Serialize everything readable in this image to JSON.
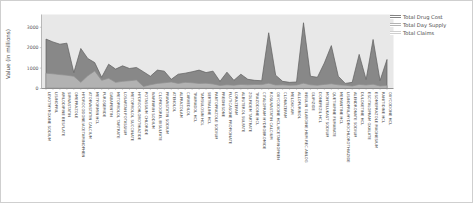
{
  "chart_data": {
    "type": "area",
    "title": "",
    "xlabel": "",
    "ylabel": "Value (in millions)",
    "ylim": [
      0,
      3400
    ],
    "yticks": [
      0,
      1000,
      2000,
      3000
    ],
    "grid": false,
    "legend_position": "top-right",
    "plot_bg_color": "#e8e8e8",
    "axis_text_color": "#555555",
    "categories": [
      "LEVOTHYROXINE SODIUM",
      "LISINOPRIL",
      "AMLODIPINE BESYLATE",
      "SIMVASTATIN",
      "OMEPRAZOLE",
      "HYDROCODONE/ACETAMINOPHEN",
      "ATORVASTATIN CALCIUM",
      "METFORMIN HCL",
      "FUROSEMIDE",
      "GABAPENTIN",
      "METOPROLOL TARTRATE",
      "LOSARTAN POTASSIUM",
      "METOPROLOL SUCCINATE",
      "HYDROCHLOROTHIAZIDE",
      "POTASSIUM CHLORIDE",
      "WARFARIN SODIUM",
      "CLOPIDOGREL BISULFATE",
      "PRAVASTATIN SODIUM",
      "ATENOLOL",
      "ALPRAZOLAM",
      "CARVEDILOL",
      "TRAMADOL HCL",
      "TAMSULOSIN HCL",
      "SERTRALINE HCL",
      "PANTOPRAZOLE SODIUM",
      "PREDNISONE",
      "FLUTICASONE PROPIONATE",
      "LORAZEPAM",
      "ALBUTEROL SULFATE",
      "ZOLPIDEM TARTRATE",
      "TRAZODONE HCL",
      "CITALOPRAM HYDROBROMIDE",
      "ROSUVASTATIN CALCIUM",
      "OXYCODONE HCL/ACETAMINOPHEN",
      "CLONAZEPAM",
      "MELOXICAM",
      "ALLOPURINOL",
      "INSULIN GLARGINE,HUM.REC.ANLOG",
      "GLIPIZIDE",
      "DONEPEZIL HCL",
      "MONTELUKAST SODIUM",
      "QUETIAPINE FUMARATE",
      "MEMANTINE HCL",
      "LISINOPRIL/HYDROCHLOROTHIAZIDE",
      "ALENDRONATE SODIUM",
      "DULOXETINE HCL",
      "ESCITALOPRAM OXALATE",
      "ESOMEPRAZOLE MAGNESIUM",
      "RANITIDINE HCL",
      "OXYCODONE HCL"
    ],
    "series": [
      {
        "name": "Total Drug Cost",
        "fill": "#838383",
        "stroke": "#5f5f5f",
        "values": [
          2420,
          2280,
          2170,
          2220,
          780,
          1960,
          1470,
          1270,
          550,
          1190,
          950,
          1110,
          980,
          1030,
          820,
          600,
          900,
          850,
          450,
          700,
          750,
          820,
          900,
          780,
          850,
          350,
          800,
          400,
          700,
          450,
          400,
          380,
          2730,
          650,
          350,
          300,
          320,
          3220,
          600,
          550,
          1250,
          2100,
          600,
          250,
          300,
          1670,
          440,
          2400,
          390,
          1420
        ]
      },
      {
        "name": "Total Day Supply",
        "fill": "#b4b4b4",
        "stroke": "#8f8f8f",
        "values": [
          750,
          720,
          680,
          650,
          600,
          300,
          620,
          860,
          400,
          500,
          300,
          350,
          380,
          420,
          100,
          180,
          250,
          280,
          320,
          250,
          300,
          280,
          250,
          260,
          220,
          150,
          180,
          160,
          200,
          180,
          200,
          190,
          260,
          170,
          180,
          160,
          170,
          260,
          180,
          160,
          200,
          230,
          180,
          160,
          120,
          200,
          170,
          210,
          120,
          150
        ]
      },
      {
        "name": "Total Claims",
        "fill": "#cfcfcf",
        "stroke": "#9a9a9a",
        "values": [
          37,
          36,
          35,
          34,
          33,
          31,
          30,
          29,
          27,
          26,
          25,
          24,
          23,
          22,
          21,
          20,
          19,
          18,
          17,
          16,
          15,
          15,
          14,
          14,
          13,
          13,
          12,
          12,
          11,
          11,
          10,
          10,
          9,
          9,
          8,
          8,
          8,
          7,
          7,
          7,
          6,
          6,
          6,
          5,
          5,
          5,
          5,
          4,
          4,
          4
        ]
      }
    ]
  }
}
